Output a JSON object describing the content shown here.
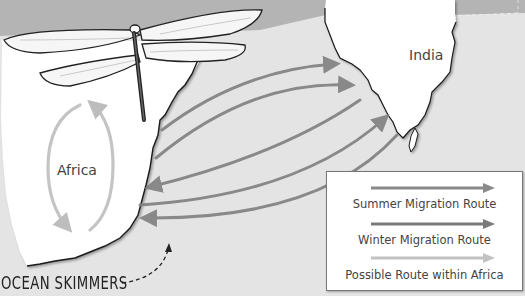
{
  "map": {
    "title": "Dragonfly migration across the Indian Ocean",
    "regions": [
      {
        "name": "India",
        "label": "India"
      },
      {
        "name": "Africa",
        "label": "Africa"
      }
    ],
    "species_label": "OCEAN SKIMMERS",
    "colors": {
      "background": "#e4e4e4",
      "top_band": "#b4b4b4",
      "land": "#ffffff",
      "summer_route": "#8a8a8a",
      "winter_route": "#7a7a7a",
      "africa_route": "#c2c2c2",
      "coastline": "#1a1a1a"
    }
  },
  "legend": {
    "items": [
      {
        "label": "Summer Migration Route",
        "color": "#8a8a8a"
      },
      {
        "label": "Winter Migration Route",
        "color": "#7a7a7a"
      },
      {
        "label": "Possible Route within Africa",
        "color": "#c2c2c2"
      }
    ]
  },
  "routes": {
    "summer_to_india": 2,
    "winter_to_africa": 3,
    "to_india_from_south": 1
  }
}
